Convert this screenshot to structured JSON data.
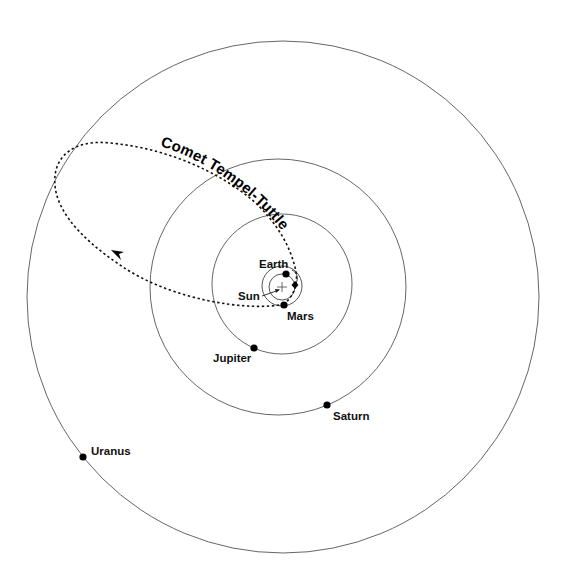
{
  "diagram": {
    "title": "Comet Tempel-Tuttle",
    "colors": {
      "orbit": "#666666",
      "planet": "#000000",
      "comet_path": "#111111",
      "background": "#ffffff"
    },
    "sun": {
      "label": "Sun",
      "icon": "plus-cross-icon"
    },
    "orbits": [
      {
        "name": "Earth",
        "radius_px": 13
      },
      {
        "name": "Mars",
        "radius_px": 20
      },
      {
        "name": "Jupiter",
        "radius_px": 70
      },
      {
        "name": "Saturn",
        "radius_px": 128
      },
      {
        "name": "Uranus",
        "radius_px": 256
      }
    ],
    "planets": [
      {
        "name": "Earth",
        "label": "Earth"
      },
      {
        "name": "Mars",
        "label": "Mars"
      },
      {
        "name": "Jupiter",
        "label": "Jupiter"
      },
      {
        "name": "Saturn",
        "label": "Saturn"
      },
      {
        "name": "Uranus",
        "label": "Uranus"
      }
    ],
    "comet": {
      "label": "Comet Tempel-Tuttle",
      "path_style": "dotted",
      "direction_arrow": "arrowhead-icon"
    }
  }
}
